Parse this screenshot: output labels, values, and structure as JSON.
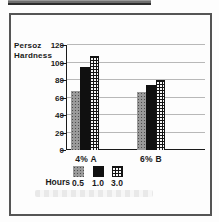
{
  "chart_data": {
    "type": "bar",
    "categories": [
      "4% A",
      "6% B"
    ],
    "series": [
      {
        "name": "0.5",
        "values": [
          67,
          66
        ]
      },
      {
        "name": "1.0",
        "values": [
          95,
          74
        ]
      },
      {
        "name": "3.0",
        "values": [
          108,
          80
        ]
      }
    ],
    "title": "",
    "xlabel": "",
    "ylabel_lines": [
      "Persoz",
      "Hardness"
    ],
    "yticks": [
      0,
      20,
      40,
      60,
      80,
      100,
      120
    ],
    "ylim": [
      0,
      120
    ],
    "grid": true,
    "legend_title": "Hours",
    "legend_entries": [
      "0.5",
      "1.0",
      "3.0"
    ],
    "legend_position": "bottom"
  },
  "styles": {
    "series_fills": [
      {
        "name": "0.5",
        "pattern": "stipple-gray",
        "color": "#9a9a9a"
      },
      {
        "name": "1.0",
        "pattern": "solid-black",
        "color": "#101010"
      },
      {
        "name": "3.0",
        "pattern": "grid-checker",
        "color": "#f7f7f7"
      }
    ],
    "gridline_color": "#b8b8b8",
    "axis_color": "#1a1a1a",
    "frame_border_color": "#555555",
    "text_color": "#1a1a1a"
  }
}
